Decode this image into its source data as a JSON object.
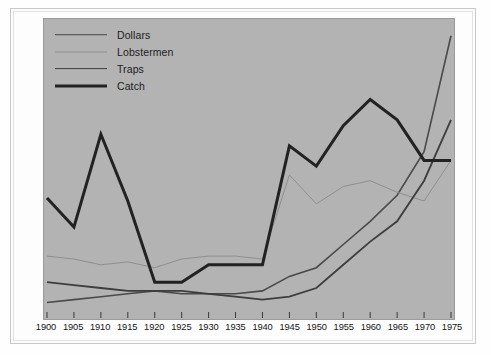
{
  "figure": {
    "panel_color": "#b3b3b3",
    "page_color": "#fdfdfd",
    "line_color": "#2b2b2b",
    "line_color_light": "#8a8a8a",
    "line_color_mid": "#555555"
  },
  "legend": {
    "position": "top-left-inside",
    "items": [
      {
        "label": "Dollars",
        "stroke_width": 1.6,
        "color": "#4a4a4a",
        "key": "dollars"
      },
      {
        "label": "Lobstermen",
        "stroke_width": 1.0,
        "color": "#8f8f8f",
        "key": "lobstermen"
      },
      {
        "label": "Traps",
        "stroke_width": 1.8,
        "color": "#3d3d3d",
        "key": "traps"
      },
      {
        "label": "Catch",
        "stroke_width": 3.0,
        "color": "#222222",
        "key": "catch"
      }
    ]
  },
  "chart_data": {
    "type": "line",
    "title": "",
    "subtitle": "",
    "xlabel": "",
    "ylabel": "",
    "grid": false,
    "yaxis_visible": false,
    "ytick_labels": [],
    "legend_position": "upper left",
    "xlim": [
      1900,
      1975
    ],
    "ylim": [
      0,
      100
    ],
    "x": [
      1900,
      1905,
      1910,
      1915,
      1920,
      1925,
      1930,
      1935,
      1940,
      1945,
      1950,
      1955,
      1960,
      1965,
      1970,
      1975
    ],
    "xtick_labels": [
      "1900",
      "1905",
      "1910",
      "1915",
      "1920",
      "1925",
      "1930",
      "1935",
      "1940",
      "1945",
      "1950",
      "1955",
      "1960",
      "1965",
      "1970",
      "1975"
    ],
    "series": [
      {
        "name": "Dollars",
        "stroke_width": 1.6,
        "color": "#4a4a4a",
        "values": [
          5,
          6,
          7,
          8,
          9,
          8,
          8,
          8,
          9,
          14,
          17,
          25,
          33,
          42,
          57,
          97
        ]
      },
      {
        "name": "Lobstermen",
        "stroke_width": 1.0,
        "color": "#8f8f8f",
        "values": [
          21,
          20,
          18,
          19,
          17,
          20,
          21,
          21,
          20,
          49,
          39,
          45,
          47,
          43,
          40,
          54
        ]
      },
      {
        "name": "Traps",
        "stroke_width": 1.8,
        "color": "#3d3d3d",
        "values": [
          12,
          11,
          10,
          9,
          9,
          9,
          8,
          7,
          6,
          7,
          10,
          18,
          26,
          33,
          47,
          68
        ]
      },
      {
        "name": "Catch",
        "stroke_width": 3.0,
        "color": "#222222",
        "values": [
          41,
          31,
          63,
          40,
          12,
          12,
          18,
          18,
          18,
          59,
          52,
          66,
          75,
          68,
          54,
          54
        ]
      }
    ]
  }
}
